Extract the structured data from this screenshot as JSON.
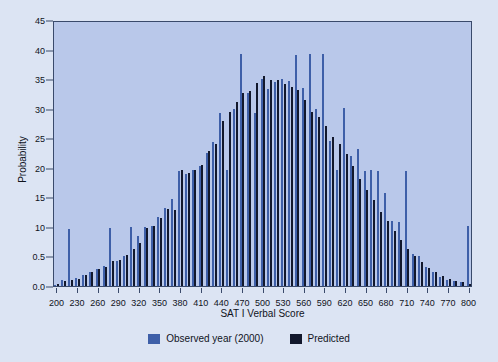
{
  "chart_data": {
    "type": "bar",
    "title": "",
    "xlabel": "SAT I Verbal Score",
    "ylabel": "Probability",
    "xlim": [
      195,
      805
    ],
    "ylim": [
      0,
      45
    ],
    "grid": false,
    "legend_position": "bottom",
    "y_ticks": [
      "0.0",
      "0.5",
      "10",
      "15",
      "20",
      "25",
      "30",
      "35",
      "40",
      "45"
    ],
    "y_tick_values": [
      0,
      5,
      10,
      15,
      20,
      25,
      30,
      35,
      40,
      45
    ],
    "x_ticks": [
      200,
      230,
      260,
      290,
      320,
      350,
      380,
      410,
      440,
      470,
      500,
      530,
      560,
      590,
      620,
      650,
      680,
      710,
      740,
      770,
      800
    ],
    "categories": [
      200,
      210,
      220,
      230,
      240,
      250,
      260,
      270,
      280,
      290,
      300,
      310,
      320,
      330,
      340,
      350,
      360,
      370,
      380,
      390,
      400,
      410,
      420,
      430,
      440,
      450,
      460,
      470,
      480,
      490,
      500,
      510,
      520,
      530,
      540,
      550,
      560,
      570,
      580,
      590,
      600,
      610,
      620,
      630,
      640,
      650,
      660,
      670,
      680,
      690,
      700,
      710,
      720,
      730,
      740,
      750,
      760,
      770,
      780,
      790,
      800
    ],
    "series": [
      {
        "name": "Observed year (2000)",
        "color": "#3e5fa8",
        "values": [
          0.2,
          1.1,
          9.7,
          1.3,
          1.9,
          2.4,
          2.9,
          3.4,
          9.8,
          4.3,
          5.1,
          9.9,
          8.5,
          9.9,
          10.1,
          11.7,
          13.2,
          14.8,
          19.5,
          18.9,
          19.6,
          20.3,
          22.5,
          24.3,
          29.3,
          19.7,
          29.9,
          39.2,
          32.6,
          29.3,
          35.1,
          33.4,
          34.5,
          35.0,
          34.6,
          39.1,
          33.5,
          39.2,
          30.0,
          39.2,
          24.6,
          19.7,
          30.1,
          22.0,
          23.2,
          19.5,
          19.7,
          19.4,
          15.8,
          11.0,
          10.8,
          19.5,
          5.4,
          5.1,
          3.2,
          2.4,
          1.5,
          1.1,
          0.8,
          0.6,
          10.1
        ]
      },
      {
        "name": "Predicted",
        "color": "#12182c",
        "values": [
          0.3,
          0.9,
          1.0,
          1.2,
          1.8,
          2.3,
          2.8,
          3.3,
          4.2,
          4.4,
          5.2,
          6.2,
          7.3,
          9.8,
          10.2,
          11.5,
          13.0,
          12.9,
          19.6,
          19.2,
          19.7,
          20.5,
          22.8,
          24.0,
          28.0,
          29.5,
          31.2,
          32.7,
          33.0,
          34.4,
          35.5,
          34.8,
          34.9,
          34.2,
          33.6,
          33.2,
          31.4,
          29.5,
          28.6,
          27.0,
          25.2,
          24.0,
          22.3,
          20.3,
          18.1,
          16.2,
          14.5,
          12.6,
          11.0,
          9.3,
          7.8,
          6.3,
          5.0,
          4.0,
          3.1,
          2.3,
          1.7,
          1.2,
          0.8,
          0.6,
          0.4
        ]
      }
    ]
  },
  "legend": [
    {
      "label": "Observed year (2000)",
      "color": "#3e5fa8",
      "key": "observed"
    },
    {
      "label": "Predicted",
      "color": "#12182c",
      "key": "predicted"
    }
  ]
}
